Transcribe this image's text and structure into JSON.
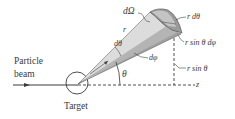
{
  "diagram": {
    "type": "scattering-geometry",
    "labels": {
      "solid_angle": "dΩ",
      "radius": "r",
      "d_theta": "dθ",
      "d_phi": "dφ",
      "theta": "θ",
      "arc_r_dtheta": "r dθ",
      "arc_r_sin_theta_dphi": "r sin θ dφ",
      "r_sin_theta": "r sin θ",
      "z_axis": "z",
      "beam_line1": "Particle",
      "beam_line2": "beam",
      "target": "Target"
    },
    "colors": {
      "line": "#3a3a3a",
      "cone_light": "#d4d4d4",
      "cone_mid": "#a8a8a8",
      "cone_dark": "#888888",
      "background": "#ffffff"
    }
  }
}
